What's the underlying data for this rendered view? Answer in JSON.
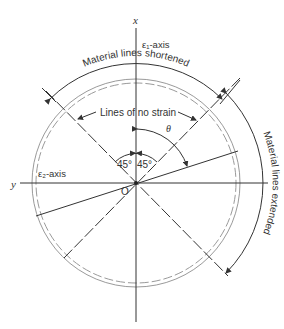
{
  "figure": {
    "axes": {
      "x_label": "x",
      "y_label": "y",
      "e1_axis_label": "ε₁-axis",
      "e2_axis_label": "ε₂-axis",
      "origin_label": "O"
    },
    "annotations": {
      "shortened": "Material lines shortened",
      "extended": "Material lines extended",
      "no_strain": "Lines of no strain",
      "theta": "θ",
      "angle_left": "45°",
      "angle_right": "45°"
    },
    "colors": {
      "line": "#333333",
      "circle_grey": "#9a9a9a",
      "background": "#ffffff"
    }
  }
}
